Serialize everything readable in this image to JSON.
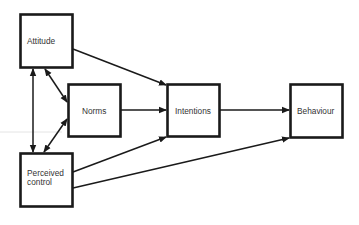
{
  "nodes": [
    {
      "id": "attitude",
      "label": [
        "Attitude"
      ]
    },
    {
      "id": "norms",
      "label": [
        "Norms"
      ]
    },
    {
      "id": "perceived_control",
      "label": [
        "Perceived",
        "control"
      ]
    },
    {
      "id": "intentions",
      "label": [
        "Intentions"
      ]
    },
    {
      "id": "behaviour",
      "label": [
        "Behaviour"
      ]
    }
  ],
  "edges": [
    {
      "from": "attitude",
      "to": "intentions",
      "type": "directed"
    },
    {
      "from": "norms",
      "to": "intentions",
      "type": "directed"
    },
    {
      "from": "perceived_control",
      "to": "intentions",
      "type": "directed"
    },
    {
      "from": "intentions",
      "to": "behaviour",
      "type": "directed"
    },
    {
      "from": "perceived_control",
      "to": "behaviour",
      "type": "directed"
    },
    {
      "from": "attitude",
      "to": "norms",
      "type": "bidirectional"
    },
    {
      "from": "attitude",
      "to": "perceived_control",
      "type": "bidirectional"
    },
    {
      "from": "norms",
      "to": "perceived_control",
      "type": "bidirectional"
    }
  ],
  "colors": {
    "stroke": "#1a1a1a",
    "text": "#333333",
    "background": "#ffffff"
  }
}
